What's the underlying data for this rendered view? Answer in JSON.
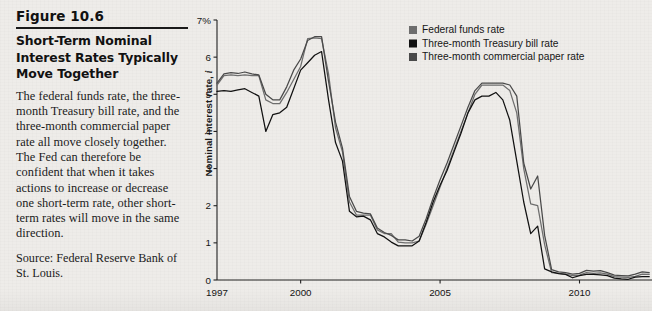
{
  "figure": {
    "number_label": "Figure 10.6",
    "title": "Short-Term Nominal Interest Rates Typically Move Together",
    "body": "The federal funds rate, the three-month Treasury bill rate, and the three-month commercial paper rate all move closely together. The Fed can therefore be confident that when it takes actions to increase or decrease one short-term rate, other short-term rates will move in the same direction.",
    "source": "Source: Federal Reserve Bank of St. Louis."
  },
  "chart_data": {
    "type": "line",
    "title": "",
    "xlabel": "",
    "ylabel": "Nominal interest rate, i",
    "ylabel_symbol": "i",
    "xlim": [
      1997.0,
      2012.6
    ],
    "ylim": [
      0,
      7
    ],
    "ytick_labels": [
      "0",
      "1",
      "2",
      "3",
      "4",
      "5",
      "6",
      "7%"
    ],
    "ytick_values": [
      0,
      1,
      2,
      3,
      4,
      5,
      6,
      7
    ],
    "xtick_labels": [
      "1997",
      "2000",
      "2005",
      "2010"
    ],
    "xtick_values": [
      1997,
      2000,
      2005,
      2010
    ],
    "grid": false,
    "legend_position": "top-right",
    "colors": {
      "federal_funds_rate": "#6e6e6e",
      "treasury_bill_rate": "#111111",
      "commercial_paper_rate": "#4a4a4a",
      "axis": "#222222",
      "background": "#eeece9"
    },
    "x": [
      1997.0,
      1997.25,
      1997.5,
      1997.75,
      1998.0,
      1998.25,
      1998.5,
      1998.75,
      1999.0,
      1999.25,
      1999.5,
      1999.75,
      2000.0,
      2000.25,
      2000.5,
      2000.75,
      2001.0,
      2001.25,
      2001.5,
      2001.75,
      2002.0,
      2002.25,
      2002.5,
      2002.75,
      2003.0,
      2003.25,
      2003.5,
      2003.75,
      2004.0,
      2004.25,
      2004.5,
      2004.75,
      2005.0,
      2005.25,
      2005.5,
      2005.75,
      2006.0,
      2006.25,
      2006.5,
      2006.75,
      2007.0,
      2007.25,
      2007.5,
      2007.75,
      2008.0,
      2008.25,
      2008.5,
      2008.75,
      2009.0,
      2009.25,
      2009.5,
      2009.75,
      2010.0,
      2010.25,
      2010.5,
      2010.75,
      2011.0,
      2011.25,
      2011.5,
      2011.75,
      2012.0,
      2012.25,
      2012.5
    ],
    "series": [
      {
        "name": "Federal funds rate",
        "color": "#6e6e6e",
        "values": [
          5.25,
          5.5,
          5.52,
          5.5,
          5.52,
          5.5,
          5.5,
          4.85,
          4.75,
          4.75,
          5.05,
          5.4,
          5.75,
          6.5,
          6.52,
          6.5,
          5.55,
          4.1,
          3.45,
          2.1,
          1.75,
          1.75,
          1.75,
          1.35,
          1.25,
          1.25,
          1.02,
          1.0,
          1.0,
          1.05,
          1.5,
          2.0,
          2.5,
          3.0,
          3.5,
          4.0,
          4.5,
          5.0,
          5.25,
          5.25,
          5.25,
          5.25,
          5.1,
          4.5,
          3.0,
          2.05,
          2.0,
          0.95,
          0.2,
          0.18,
          0.16,
          0.12,
          0.13,
          0.2,
          0.18,
          0.19,
          0.16,
          0.09,
          0.08,
          0.07,
          0.1,
          0.16,
          0.15
        ]
      },
      {
        "name": "Three-month Treasury bill rate",
        "color": "#111111",
        "values": [
          5.08,
          5.1,
          5.08,
          5.12,
          5.15,
          5.05,
          4.95,
          4.0,
          4.45,
          4.5,
          4.65,
          5.15,
          5.65,
          5.85,
          6.05,
          6.15,
          4.85,
          3.7,
          3.2,
          1.85,
          1.7,
          1.72,
          1.62,
          1.25,
          1.16,
          1.02,
          0.92,
          0.92,
          0.92,
          1.05,
          1.55,
          2.1,
          2.55,
          2.95,
          3.45,
          3.95,
          4.5,
          4.85,
          4.95,
          4.95,
          5.05,
          4.85,
          4.3,
          3.2,
          2.1,
          1.25,
          1.45,
          0.3,
          0.22,
          0.17,
          0.15,
          0.06,
          0.12,
          0.15,
          0.15,
          0.14,
          0.12,
          0.05,
          0.03,
          0.02,
          0.08,
          0.09,
          0.09
        ]
      },
      {
        "name": "Three-month commercial paper rate",
        "color": "#4a4a4a",
        "values": [
          5.3,
          5.55,
          5.58,
          5.56,
          5.6,
          5.55,
          5.52,
          5.0,
          4.85,
          4.85,
          5.2,
          5.65,
          5.95,
          6.45,
          6.55,
          6.55,
          5.35,
          4.25,
          3.55,
          2.25,
          1.85,
          1.8,
          1.78,
          1.4,
          1.28,
          1.2,
          1.08,
          1.08,
          1.05,
          1.18,
          1.65,
          2.2,
          2.7,
          3.15,
          3.65,
          4.15,
          4.65,
          5.1,
          5.3,
          5.3,
          5.3,
          5.3,
          5.25,
          4.95,
          3.15,
          2.45,
          2.8,
          1.2,
          0.28,
          0.22,
          0.2,
          0.16,
          0.18,
          0.26,
          0.24,
          0.25,
          0.2,
          0.13,
          0.12,
          0.11,
          0.16,
          0.22,
          0.2
        ]
      }
    ]
  },
  "legend": {
    "items": [
      {
        "label": "Federal funds rate",
        "swatch": "#6e6e6e"
      },
      {
        "label": "Three-month Treasury bill rate",
        "swatch": "#111111"
      },
      {
        "label": "Three-month commercial paper rate",
        "swatch": "#4a4a4a"
      }
    ]
  }
}
